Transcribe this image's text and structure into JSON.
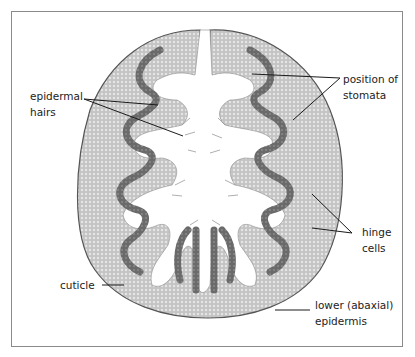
{
  "figure": {
    "colors": {
      "tissue_light": "#b9b9b9",
      "tissue_dark": "#6a6a6a",
      "tissue_darker": "#4e4e4e",
      "leader_line": "#1a1a1a",
      "border": "#8a8a8a"
    }
  },
  "labels": {
    "epidermal_hairs": [
      "epidermal",
      "hairs"
    ],
    "position_of_stomata": [
      "position of",
      "stomata"
    ],
    "hinge_cells": [
      "hinge",
      "cells"
    ],
    "cuticle": "cuticle",
    "lower_epidermis": [
      "lower (abaxial)",
      "epidermis"
    ]
  }
}
